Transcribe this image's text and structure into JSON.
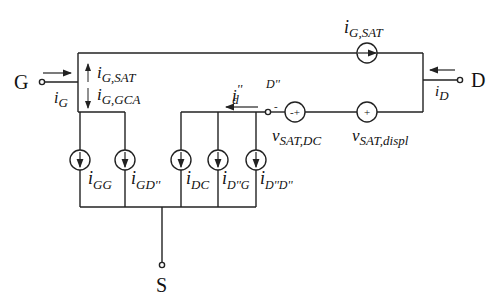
{
  "diagram": {
    "type": "equivalent-circuit",
    "terminals": {
      "gate": "G",
      "drain": "D",
      "source": "S",
      "internal_node": "D''"
    },
    "currents": {
      "i_G": {
        "main": "i",
        "sub": "G"
      },
      "i_D": {
        "main": "i",
        "sub": "D"
      },
      "i_d2": {
        "main": "i",
        "sub": "d",
        "sup": "''"
      },
      "i_G_SAT_top": {
        "main": "i",
        "sub": "G,SAT"
      },
      "i_G_SAT_arrow": {
        "main": "i",
        "sub": "G,SAT"
      },
      "i_G_GCA": {
        "main": "i",
        "sub": "G,GCA"
      }
    },
    "current_sources": [
      {
        "main": "i",
        "sub": "GG"
      },
      {
        "main": "i",
        "sub": "GD''"
      },
      {
        "main": "i",
        "sub": "DC"
      },
      {
        "main": "i",
        "sub": "D''G"
      },
      {
        "main": "i",
        "sub": "D''D''"
      }
    ],
    "voltage_sources": [
      {
        "main": "v",
        "sub": "SAT,DC",
        "polarity": "-+",
        "minus_mark": "-"
      },
      {
        "main": "v",
        "sub": "SAT,displ",
        "polarity": "+"
      }
    ],
    "symbols": {
      "plus": "+",
      "minus_plus": "-+"
    }
  }
}
